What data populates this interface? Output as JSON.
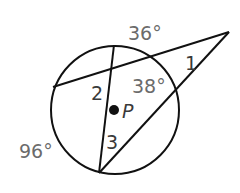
{
  "diagram": {
    "arcs": {
      "top_arc": "36°",
      "left_arc": "96°",
      "inner_arc": "38°"
    },
    "angles": {
      "angle1": "1",
      "angle2": "2",
      "angle3": "3"
    },
    "center": {
      "label": "P"
    },
    "colors": {
      "stroke": "#111111",
      "arc_label": "#6b6b6b",
      "angle_label": "#3a3a3a"
    }
  }
}
